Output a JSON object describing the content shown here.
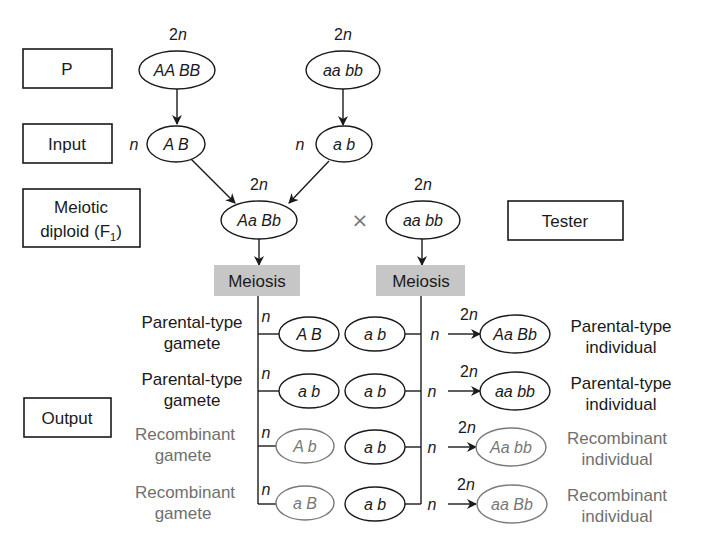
{
  "row_labels": {
    "p": "P",
    "input": "Input",
    "meiotic_diploid_line1": "Meiotic",
    "meiotic_diploid_line2": "diploid (F",
    "meiotic_diploid_sub": "1",
    "meiotic_diploid_close": ")",
    "tester": "Tester",
    "output": "Output"
  },
  "ploidy": {
    "diploid_num": "2",
    "diploid_var": "n",
    "haploid": "n"
  },
  "parents": {
    "left_genotype": "AA BB",
    "right_genotype": "aa bb"
  },
  "input_gametes": {
    "left": "A B",
    "right": "a b"
  },
  "f1": {
    "genotype": "Aa Bb",
    "cross_symbol": "×",
    "tester_genotype": "aa bb"
  },
  "meiosis": {
    "left_label": "Meiosis",
    "right_label": "Meiosis"
  },
  "output_rows": [
    {
      "gamete_label_1": "Parental-type",
      "gamete_label_2": "gamete",
      "gamete": "A B",
      "tester_gamete": "a b",
      "offspring": "Aa Bb",
      "offspring_label_1": "Parental-type",
      "offspring_label_2": "individual",
      "type": "parental"
    },
    {
      "gamete_label_1": "Parental-type",
      "gamete_label_2": "gamete",
      "gamete": "a b",
      "tester_gamete": "a b",
      "offspring": "aa bb",
      "offspring_label_1": "Parental-type",
      "offspring_label_2": "individual",
      "type": "parental"
    },
    {
      "gamete_label_1": "Recombinant",
      "gamete_label_2": "gamete",
      "gamete": "A b",
      "tester_gamete": "a b",
      "offspring": "Aa bb",
      "offspring_label_1": "Recombinant",
      "offspring_label_2": "individual",
      "type": "recombinant"
    },
    {
      "gamete_label_1": "Recombinant",
      "gamete_label_2": "gamete",
      "gamete": "a B",
      "tester_gamete": "a b",
      "offspring": "aa Bb",
      "offspring_label_1": "Recombinant",
      "offspring_label_2": "individual",
      "type": "recombinant"
    }
  ],
  "colors": {
    "ink": "#1a1a1a",
    "recombinant_ink": "#777777",
    "meiosis_fill": "#c6c6c6"
  }
}
